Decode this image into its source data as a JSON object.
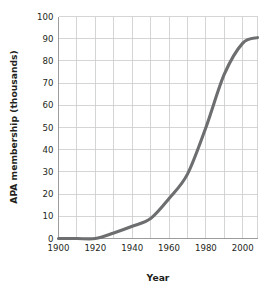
{
  "chart_data": {
    "type": "line",
    "title": "",
    "xlabel": "Year",
    "ylabel": "APA membership (thousands)",
    "xlim": [
      1900,
      2008
    ],
    "ylim": [
      0,
      100
    ],
    "xticks": [
      1900,
      1920,
      1940,
      1960,
      1980,
      2000
    ],
    "xtick_labels": [
      "1900",
      "1920",
      "1940",
      "1960",
      "1980",
      "2000"
    ],
    "yticks": [
      0,
      10,
      20,
      30,
      40,
      50,
      60,
      70,
      80,
      90,
      100
    ],
    "ytick_labels": [
      "0",
      "10",
      "20",
      "30",
      "40",
      "50",
      "60",
      "70",
      "80",
      "90",
      "100"
    ],
    "x_gridline_step": 10,
    "y_gridline_step": 10,
    "grid": true,
    "legend": false,
    "legend_position": "none",
    "series": [
      {
        "name": "APA membership",
        "color": "#6d6e70",
        "x": [
          1900,
          1910,
          1920,
          1930,
          1940,
          1950,
          1960,
          1970,
          1980,
          1990,
          2000,
          2008
        ],
        "values": [
          0,
          0,
          0,
          2.5,
          5.5,
          9,
          18,
          29,
          50,
          74,
          88,
          90.5
        ]
      }
    ],
    "series_color": "#6d6e70",
    "grid_color": "#c9cacb",
    "axis_color": "#9b9c9e",
    "text_color": "#231f20",
    "background": "#ffffff"
  }
}
